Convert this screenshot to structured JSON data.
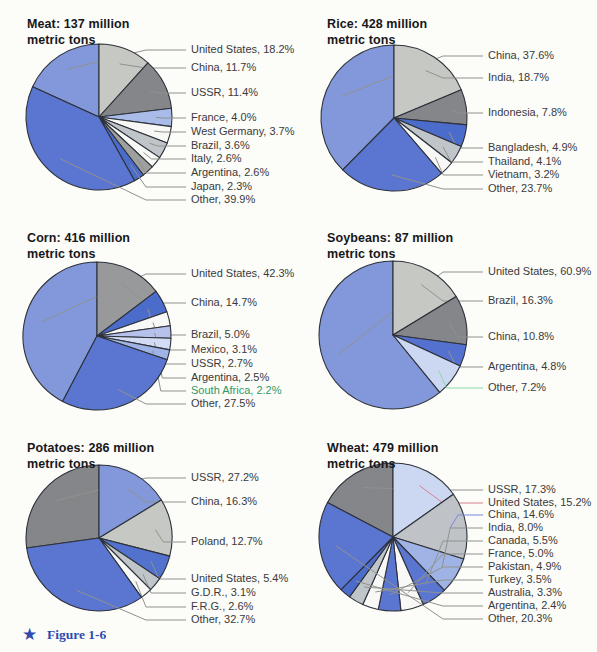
{
  "figure_caption": {
    "icon": "star-icon",
    "star_glyph": "★",
    "label": "Figure 1-6",
    "color": "#2d4cae"
  },
  "style_colors": {
    "slice_outline": "#2d3139",
    "leader_line": "#90928e",
    "label_text": "#3a3a3c",
    "title_text": "#17171a",
    "background": "#fcfcf9"
  },
  "chart_data": [
    {
      "type": "pie",
      "product": "Meat",
      "title_line1": "Meat: 137 million",
      "title_line2": "metric tons",
      "layout": {
        "cx": 99,
        "cy": 117,
        "r": 73,
        "label_x": 191,
        "title_x": 27,
        "title_y": 16
      },
      "slices": [
        {
          "name": "United States",
          "pct": 18.2,
          "color": "#8298db",
          "label_y": 50
        },
        {
          "name": "China",
          "pct": 11.7,
          "color": "#c6c8c4",
          "label_y": 68
        },
        {
          "name": "USSR",
          "pct": 11.4,
          "color": "#84868a",
          "label_y": 93
        },
        {
          "name": "France",
          "pct": 4.0,
          "color": "#a9bce9",
          "label_y": 118
        },
        {
          "name": "West Germany",
          "pct": 3.7,
          "color": "#f8f9f7",
          "label_y": 132
        },
        {
          "name": "Brazil",
          "pct": 3.6,
          "color": "#c0c5c9",
          "label_y": 146
        },
        {
          "name": "Italy",
          "pct": 2.6,
          "color": "#f8f9f7",
          "label_y": 159
        },
        {
          "name": "Argentina",
          "pct": 2.6,
          "color": "#9da09c",
          "label_y": 173
        },
        {
          "name": "Japan",
          "pct": 2.3,
          "color": "#4c6ccb",
          "label_y": 187
        },
        {
          "name": "Other",
          "pct": 39.9,
          "color": "#5b76d0",
          "label_y": 200
        }
      ]
    },
    {
      "type": "pie",
      "product": "Rice",
      "title_line1": "Rice: 428 million",
      "title_line2": "metric tons",
      "layout": {
        "cx": 394,
        "cy": 118,
        "r": 73,
        "label_x": 488,
        "title_x": 327,
        "title_y": 16
      },
      "slices": [
        {
          "name": "China",
          "pct": 37.6,
          "color": "#8298db",
          "label_y": 56
        },
        {
          "name": "India",
          "pct": 18.7,
          "color": "#c6c8c4",
          "label_y": 78
        },
        {
          "name": "Indonesia",
          "pct": 7.8,
          "color": "#84868a",
          "label_y": 113
        },
        {
          "name": "Bangladesh",
          "pct": 4.9,
          "color": "#4c6ccb",
          "label_y": 148
        },
        {
          "name": "Thailand",
          "pct": 4.1,
          "color": "#c0c5c9",
          "label_y": 162
        },
        {
          "name": "Vietnam",
          "pct": 3.2,
          "color": "#f8f9f7",
          "label_y": 175
        },
        {
          "name": "Other",
          "pct": 23.7,
          "color": "#5b76d0",
          "label_y": 189
        }
      ]
    },
    {
      "type": "pie",
      "product": "Corn",
      "title_line1": "Corn: 416 million",
      "title_line2": "metric tons",
      "layout": {
        "cx": 97,
        "cy": 336,
        "r": 74,
        "label_x": 191,
        "title_x": 27,
        "title_y": 230
      },
      "slices": [
        {
          "name": "United States",
          "pct": 42.3,
          "color": "#8298db",
          "label_y": 274
        },
        {
          "name": "China",
          "pct": 14.7,
          "color": "#97999b",
          "label_y": 303
        },
        {
          "name": "Brazil",
          "pct": 5.0,
          "color": "#4c6ccb",
          "label_y": 335
        },
        {
          "name": "Mexico",
          "pct": 3.1,
          "color": "#f8f9f7",
          "label_y": 350
        },
        {
          "name": "USSR",
          "pct": 2.7,
          "color": "#b6c2ec",
          "label_y": 364
        },
        {
          "name": "Argentina",
          "pct": 2.5,
          "color": "#d3dcf4",
          "label_y": 378
        },
        {
          "name": "South Africa",
          "pct": 2.2,
          "color": "#a0b3e5",
          "label_y": 391,
          "label_color": "#2f9968"
        },
        {
          "name": "Other",
          "pct": 27.5,
          "color": "#5b76d0",
          "label_y": 404
        }
      ]
    },
    {
      "type": "pie",
      "product": "Soybeans",
      "title_line1": "Soybeans: 87 million",
      "title_line2": "metric tons",
      "layout": {
        "cx": 393,
        "cy": 335,
        "r": 74,
        "label_x": 488,
        "title_x": 327,
        "title_y": 230
      },
      "slices": [
        {
          "name": "United States",
          "pct": 60.9,
          "color": "#8298db",
          "label_y": 272
        },
        {
          "name": "Brazil",
          "pct": 16.3,
          "color": "#c6c8c4",
          "label_y": 301
        },
        {
          "name": "China",
          "pct": 10.8,
          "color": "#84868a",
          "label_y": 337
        },
        {
          "name": "Argentina",
          "pct": 4.8,
          "color": "#5571d0",
          "label_y": 367
        },
        {
          "name": "Other",
          "pct": 7.2,
          "color": "#ccd8f1",
          "label_y": 388,
          "line_color": "#8cd8a8"
        }
      ]
    },
    {
      "type": "pie",
      "product": "Potatoes",
      "title_line1": "Potatoes: 286 million",
      "title_line2": "metric tons",
      "layout": {
        "cx": 99,
        "cy": 538,
        "r": 73,
        "label_x": 191,
        "title_x": 27,
        "title_y": 440
      },
      "slices": [
        {
          "name": "USSR",
          "pct": 27.2,
          "color": "#84868a",
          "label_y": 478
        },
        {
          "name": "China",
          "pct": 16.3,
          "color": "#8298db",
          "label_y": 502
        },
        {
          "name": "Poland",
          "pct": 12.7,
          "color": "#c6c8c4",
          "label_y": 542
        },
        {
          "name": "United States",
          "pct": 5.4,
          "color": "#5272cd",
          "label_y": 579
        },
        {
          "name": "G.D.R.",
          "pct": 3.1,
          "color": "#c0c5c9",
          "label_y": 593
        },
        {
          "name": "F.R.G.",
          "pct": 2.6,
          "color": "#f8f9f7",
          "label_y": 607
        },
        {
          "name": "Other",
          "pct": 32.7,
          "color": "#5b76d0",
          "label_y": 620
        }
      ]
    },
    {
      "type": "pie",
      "product": "Wheat",
      "title_line1": "Wheat: 479 million",
      "title_line2": "metric tons",
      "layout": {
        "cx": 393,
        "cy": 537,
        "r": 74,
        "label_x": 488,
        "title_x": 327,
        "title_y": 440
      },
      "slices": [
        {
          "name": "USSR",
          "pct": 17.3,
          "color": "#84868a",
          "label_y": 490
        },
        {
          "name": "United States",
          "pct": 15.2,
          "color": "#ccd8f1",
          "label_y": 503,
          "line_color": "#d9808e"
        },
        {
          "name": "China",
          "pct": 14.6,
          "color": "#bfc3c7",
          "label_y": 515,
          "line_color": "#7989da"
        },
        {
          "name": "India",
          "pct": 8.0,
          "color": "#a0b3e5",
          "label_y": 528
        },
        {
          "name": "Canada",
          "pct": 5.5,
          "color": "#5b76d0",
          "label_y": 541
        },
        {
          "name": "France",
          "pct": 5.0,
          "color": "#f8f9f7",
          "label_y": 554
        },
        {
          "name": "Pakistan",
          "pct": 4.9,
          "color": "#5b76d0",
          "label_y": 567
        },
        {
          "name": "Turkey",
          "pct": 3.5,
          "color": "#f8f9f7",
          "label_y": 580
        },
        {
          "name": "Australia",
          "pct": 3.3,
          "color": "#c0c5c9",
          "label_y": 593
        },
        {
          "name": "Argentina",
          "pct": 2.4,
          "color": "#4c6ccb",
          "label_y": 606
        },
        {
          "name": "Other",
          "pct": 20.3,
          "color": "#5b76d0",
          "label_y": 619
        }
      ]
    }
  ]
}
